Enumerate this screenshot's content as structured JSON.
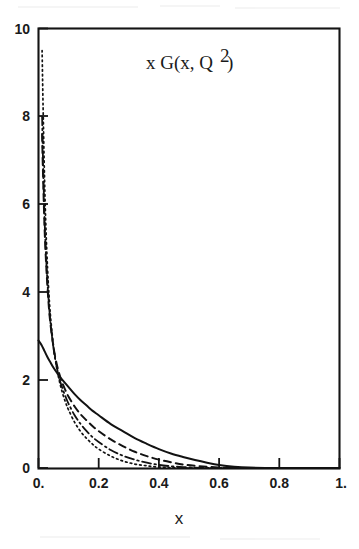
{
  "figure": {
    "title_parts": {
      "prefix": "x G(x, Q",
      "superscript": "2",
      "suffix": ")"
    },
    "xlabel": "x",
    "ylabel": "",
    "background_color": "#ffffff",
    "ink_color": "#121212"
  },
  "axes": {
    "x_ticks": [
      "0.",
      "0.2",
      "0.4",
      "0.6",
      "0.8",
      "1."
    ],
    "x_tick_values": [
      0,
      0.2,
      0.4,
      0.6,
      0.8,
      1.0
    ],
    "y_ticks": [
      "0",
      "2",
      "4",
      "6",
      "8",
      "10"
    ],
    "y_tick_values": [
      0,
      2,
      4,
      6,
      8,
      10
    ],
    "xlim": [
      0,
      1.0
    ],
    "ylim": [
      0,
      10
    ],
    "grid": false
  },
  "chart_data": {
    "type": "line",
    "xlabel": "x",
    "ylabel": "",
    "xlim": [
      0,
      1.0
    ],
    "ylim": [
      0,
      10
    ],
    "grid": false,
    "legend": "none",
    "series": [
      {
        "name": "solid",
        "style": "solid",
        "x": [
          0.0,
          0.01,
          0.02,
          0.03,
          0.04,
          0.05,
          0.06,
          0.07,
          0.08,
          0.09,
          0.1,
          0.12,
          0.14,
          0.16,
          0.18,
          0.2,
          0.24,
          0.28,
          0.32,
          0.36,
          0.4,
          0.44,
          0.48,
          0.52,
          0.56,
          0.6,
          0.65,
          0.7,
          0.8,
          0.9,
          1.0
        ],
        "y": [
          2.9,
          2.8,
          2.66,
          2.52,
          2.4,
          2.28,
          2.18,
          2.08,
          2.0,
          1.92,
          1.84,
          1.68,
          1.54,
          1.42,
          1.3,
          1.2,
          1.0,
          0.84,
          0.68,
          0.55,
          0.43,
          0.33,
          0.25,
          0.18,
          0.12,
          0.07,
          0.03,
          0.01,
          0.0,
          0.0,
          0.0
        ]
      },
      {
        "name": "dashed",
        "style": "dashed",
        "x": [
          0.012,
          0.015,
          0.02,
          0.025,
          0.03,
          0.035,
          0.04,
          0.05,
          0.06,
          0.07,
          0.08,
          0.09,
          0.1,
          0.12,
          0.14,
          0.16,
          0.18,
          0.2,
          0.24,
          0.28,
          0.32,
          0.36,
          0.4,
          0.44,
          0.48,
          0.52,
          0.56,
          0.6,
          0.7,
          0.8,
          1.0
        ],
        "y": [
          7.6,
          6.7,
          5.5,
          4.7,
          4.1,
          3.62,
          3.26,
          2.74,
          2.38,
          2.12,
          1.92,
          1.76,
          1.62,
          1.4,
          1.22,
          1.08,
          0.95,
          0.84,
          0.65,
          0.5,
          0.37,
          0.27,
          0.19,
          0.13,
          0.08,
          0.05,
          0.03,
          0.01,
          0.0,
          0.0,
          0.0
        ]
      },
      {
        "name": "dash-dot",
        "style": "dash-dot",
        "x": [
          0.012,
          0.015,
          0.02,
          0.025,
          0.03,
          0.035,
          0.04,
          0.05,
          0.06,
          0.07,
          0.08,
          0.09,
          0.1,
          0.12,
          0.14,
          0.16,
          0.18,
          0.2,
          0.24,
          0.28,
          0.32,
          0.36,
          0.4,
          0.44,
          0.48,
          0.52,
          0.56,
          0.6,
          0.7,
          1.0
        ],
        "y": [
          8.0,
          7.0,
          5.7,
          4.85,
          4.2,
          3.7,
          3.3,
          2.72,
          2.32,
          2.02,
          1.8,
          1.62,
          1.46,
          1.2,
          1.0,
          0.84,
          0.7,
          0.59,
          0.41,
          0.28,
          0.19,
          0.12,
          0.07,
          0.04,
          0.02,
          0.01,
          0.0,
          0.0,
          0.0,
          0.0
        ]
      },
      {
        "name": "dotted",
        "style": "dotted",
        "x": [
          0.012,
          0.015,
          0.02,
          0.025,
          0.03,
          0.035,
          0.04,
          0.05,
          0.06,
          0.07,
          0.08,
          0.09,
          0.1,
          0.12,
          0.14,
          0.16,
          0.18,
          0.2,
          0.24,
          0.28,
          0.32,
          0.36,
          0.4,
          0.44,
          0.48,
          0.52,
          1.0
        ],
        "y": [
          9.5,
          8.3,
          6.6,
          5.4,
          4.55,
          3.92,
          3.44,
          2.76,
          2.3,
          1.96,
          1.7,
          1.49,
          1.32,
          1.04,
          0.83,
          0.67,
          0.54,
          0.43,
          0.27,
          0.16,
          0.09,
          0.05,
          0.02,
          0.01,
          0.0,
          0.0,
          0.0
        ]
      }
    ]
  }
}
